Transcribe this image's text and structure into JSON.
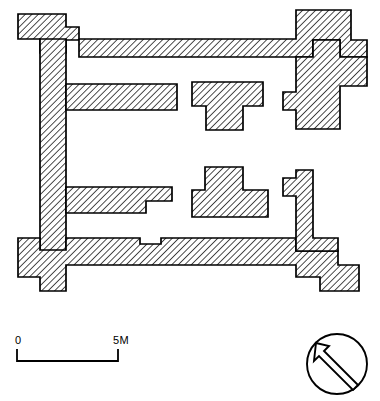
{
  "drawing": {
    "kind": "archaeological-floor-plan",
    "title": "",
    "ink_color": "#000000",
    "paper_color": "#ffffff",
    "hatch_color": "#1a1a1a",
    "hatch_angle_deg": 45,
    "hatch_spacing_px": 3.2,
    "stroke_width_px": 1.6
  },
  "scale_bar": {
    "name": "scale-bar",
    "start_label": "0",
    "end_label": "5M",
    "units": "M",
    "length_meters": 5,
    "bar_x_start_px": 16,
    "bar_x_end_px": 118,
    "bar_y_px": 358,
    "tick_height_px": 9,
    "label_font_size_px": 10
  },
  "north_arrow": {
    "name": "north-arrow",
    "center_x_px": 337,
    "center_y_px": 364,
    "radius_px": 30,
    "arrow_bearing_deg": 315,
    "arrow_style": "hollow-outline",
    "label": ""
  },
  "walls": {
    "description": "Stone walls shown in section with 45-degree hatching",
    "outer_enclosure": [
      [
        18,
        14
      ],
      [
        66,
        14
      ],
      [
        66,
        26
      ],
      [
        78,
        26
      ],
      [
        78,
        39
      ],
      [
        296,
        39
      ],
      [
        296,
        10
      ],
      [
        350,
        10
      ],
      [
        350,
        40
      ],
      [
        366,
        40
      ],
      [
        366,
        56
      ],
      [
        340,
        56
      ],
      [
        340,
        77
      ],
      [
        312,
        77
      ],
      [
        312,
        57
      ],
      [
        296,
        57
      ],
      [
        296,
        39
      ],
      [
        78,
        39
      ],
      [
        78,
        57
      ],
      [
        296,
        57
      ],
      [
        296,
        77
      ],
      [
        312,
        77
      ],
      [
        340,
        77
      ],
      [
        340,
        56
      ],
      [
        366,
        56
      ],
      [
        366,
        40
      ],
      [
        350,
        40
      ],
      [
        350,
        10
      ],
      [
        296,
        10
      ],
      [
        296,
        39
      ]
    ],
    "segments": [
      {
        "name": "top-wall",
        "polygon": [
          [
            18,
            14
          ],
          [
            66,
            14
          ],
          [
            66,
            26
          ],
          [
            78,
            26
          ],
          [
            78,
            39
          ],
          [
            296,
            39
          ],
          [
            296,
            10
          ],
          [
            350,
            10
          ],
          [
            350,
            39
          ],
          [
            366,
            39
          ],
          [
            366,
            56
          ],
          [
            340,
            56
          ],
          [
            340,
            39
          ],
          [
            296,
            39
          ],
          [
            296,
            57
          ],
          [
            78,
            57
          ],
          [
            78,
            39
          ],
          [
            66,
            39
          ],
          [
            66,
            53
          ],
          [
            40,
            53
          ],
          [
            40,
            39
          ],
          [
            18,
            39
          ]
        ]
      },
      {
        "name": "left-wall",
        "polygon": [
          [
            40,
            39
          ],
          [
            66,
            39
          ],
          [
            66,
            262
          ],
          [
            40,
            262
          ]
        ]
      },
      {
        "name": "upper-cross-wall",
        "polygon": [
          [
            66,
            84
          ],
          [
            177,
            84
          ],
          [
            177,
            110
          ],
          [
            66,
            110
          ]
        ]
      },
      {
        "name": "lower-cross-wall",
        "polygon": [
          [
            66,
            187
          ],
          [
            172,
            187
          ],
          [
            172,
            201
          ],
          [
            146,
            201
          ],
          [
            146,
            213
          ],
          [
            66,
            213
          ]
        ]
      },
      {
        "name": "bottom-wall",
        "polygon": [
          [
            18,
            237
          ],
          [
            40,
            237
          ],
          [
            40,
            250
          ],
          [
            66,
            250
          ],
          [
            66,
            237
          ],
          [
            140,
            237
          ],
          [
            140,
            244
          ],
          [
            160,
            244
          ],
          [
            160,
            237
          ],
          [
            296,
            237
          ],
          [
            296,
            250
          ],
          [
            338,
            250
          ],
          [
            338,
            264
          ],
          [
            358,
            264
          ],
          [
            358,
            290
          ],
          [
            320,
            290
          ],
          [
            320,
            276
          ],
          [
            296,
            276
          ],
          [
            296,
            264
          ],
          [
            66,
            264
          ],
          [
            66,
            290
          ],
          [
            40,
            290
          ],
          [
            40,
            276
          ],
          [
            18,
            276
          ]
        ]
      },
      {
        "name": "right-wall-upper-stub",
        "polygon": [
          [
            288,
            84
          ],
          [
            312,
            84
          ],
          [
            312,
            128
          ],
          [
            288,
            128
          ],
          [
            288,
            110
          ],
          [
            278,
            110
          ],
          [
            278,
            92
          ],
          [
            288,
            92
          ]
        ]
      },
      {
        "name": "right-wall-lower-stub",
        "polygon": [
          [
            288,
            170
          ],
          [
            312,
            170
          ],
          [
            312,
            236
          ],
          [
            288,
            236
          ],
          [
            288,
            196
          ],
          [
            278,
            196
          ],
          [
            278,
            178
          ],
          [
            288,
            178
          ]
        ]
      },
      {
        "name": "upper-t-pier",
        "polygon": [
          [
            192,
            82
          ],
          [
            263,
            82
          ],
          [
            263,
            106
          ],
          [
            243,
            106
          ],
          [
            243,
            130
          ],
          [
            206,
            130
          ],
          [
            206,
            106
          ],
          [
            192,
            106
          ]
        ]
      },
      {
        "name": "lower-t-pier",
        "polygon": [
          [
            205,
            167
          ],
          [
            243,
            167
          ],
          [
            243,
            190
          ],
          [
            268,
            190
          ],
          [
            268,
            217
          ],
          [
            192,
            217
          ],
          [
            192,
            190
          ],
          [
            205,
            190
          ]
        ]
      }
    ]
  },
  "caption": {
    "text": "",
    "visible": false
  }
}
